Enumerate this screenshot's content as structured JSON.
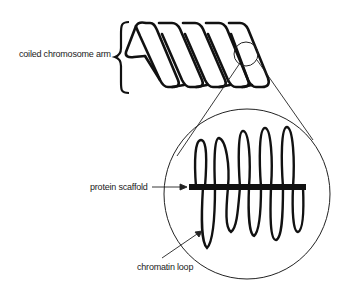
{
  "diagram": {
    "type": "chromosome-structure",
    "labels": {
      "coiled_arm": "coiled chromosome arm",
      "protein_scaffold": "protein scaffold",
      "chromatin_loop": "chromatin loop"
    },
    "colors": {
      "stroke": "#111111",
      "background": "#ffffff",
      "text": "#222222"
    },
    "elements": [
      {
        "name": "coiled chromosome arm",
        "description": "helical coil of 5 turns with a bracket on its left"
      },
      {
        "name": "magnified region",
        "description": "small circle on coil expanded into large circle"
      },
      {
        "name": "protein scaffold",
        "description": "horizontal thick bar"
      },
      {
        "name": "chromatin loops",
        "description": "vertical loops crossing the scaffold"
      }
    ]
  }
}
